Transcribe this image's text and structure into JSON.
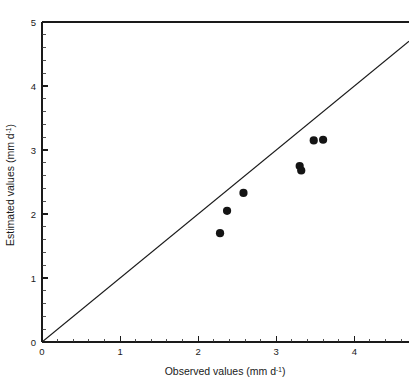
{
  "chart_data": {
    "type": "scatter",
    "title": "",
    "xlabel": "Observed values (mm d-1)",
    "ylabel": "Estimated values (mm d-1)",
    "xlabel_base": "Observed values (mm d",
    "xlabel_sup": "-1",
    "xlabel_tail": ")",
    "ylabel_base": "Estimated values (mm d",
    "ylabel_sup": "-1",
    "ylabel_tail": ")",
    "xlim": [
      0,
      4.7
    ],
    "ylim": [
      0,
      5
    ],
    "xticks": [
      0,
      1,
      2,
      3,
      4
    ],
    "yticks": [
      0,
      1,
      2,
      3,
      4,
      5
    ],
    "xtick_labels": [
      "0",
      "1",
      "2",
      "3",
      "4"
    ],
    "ytick_labels": [
      "0",
      "1",
      "2",
      "3",
      "4",
      "5"
    ],
    "minor_tick_interval": 0.2,
    "grid": false,
    "legend": false,
    "marker_color": "#141414",
    "line_color": "#1a1a1a",
    "reference_line": {
      "name": "1:1 identity line",
      "x": [
        0,
        4.7
      ],
      "y": [
        0,
        4.7
      ]
    },
    "series": [
      {
        "name": "Estimated vs Observed",
        "points": [
          {
            "x": 2.28,
            "y": 1.7
          },
          {
            "x": 2.37,
            "y": 2.05
          },
          {
            "x": 2.58,
            "y": 2.33
          },
          {
            "x": 3.3,
            "y": 2.75
          },
          {
            "x": 3.32,
            "y": 2.68
          },
          {
            "x": 3.48,
            "y": 3.15
          },
          {
            "x": 3.6,
            "y": 3.16
          }
        ]
      }
    ]
  }
}
